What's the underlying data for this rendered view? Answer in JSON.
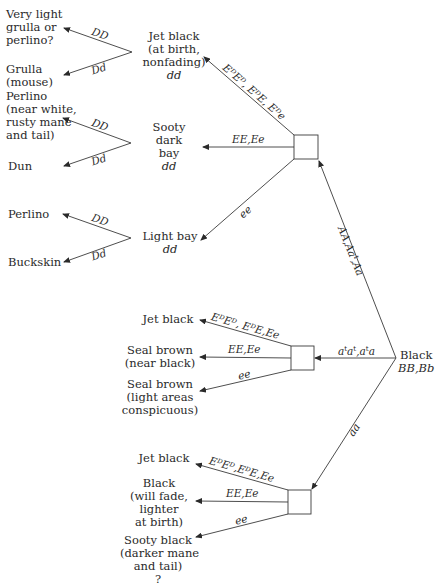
{
  "diagram": {
    "root": {
      "label": "Black",
      "genotype": "BB,Bb"
    },
    "root_branches": [
      {
        "label": "AA,Aa",
        "label_sup": "t",
        "label_full": "AA,Aat,Aa",
        "target": "group1"
      },
      {
        "label": "atat,ata",
        "label_full": "aᵗaᵗ,aᵗa",
        "target": "group2"
      },
      {
        "label": "aa",
        "target": "group3"
      }
    ],
    "group1": {
      "branches": [
        {
          "edge": "EᴰEᴰ, EᴰE, Eᴰe",
          "node": {
            "lines": [
              "Jet black",
              "(at birth,",
              "nonfading)"
            ],
            "genotype": "dd"
          }
        },
        {
          "edge": "EE,Ee",
          "node": {
            "lines": [
              "Sooty",
              "dark",
              "bay"
            ],
            "genotype": "dd"
          }
        },
        {
          "edge": "ee",
          "node": {
            "lines": [
              "Light bay"
            ],
            "genotype": "dd"
          }
        }
      ],
      "dun_forks": [
        {
          "from": "Jet black",
          "DD": {
            "edge": "DD",
            "lines": [
              "Very light",
              "grulla or",
              "perlino?"
            ]
          },
          "Dd": {
            "edge": "Dd",
            "lines": [
              "Grulla",
              "(mouse)"
            ]
          }
        },
        {
          "from": "Sooty dark bay",
          "DD": {
            "edge": "DD",
            "lines": [
              "Perlino",
              "(near white,",
              "rusty mane",
              "and tail)"
            ]
          },
          "Dd": {
            "edge": "Dd",
            "lines": [
              "Dun"
            ]
          }
        },
        {
          "from": "Light bay",
          "DD": {
            "edge": "DD",
            "lines": [
              "Perlino"
            ]
          },
          "Dd": {
            "edge": "Dd",
            "lines": [
              "Buckskin"
            ]
          }
        }
      ]
    },
    "group2": {
      "branches": [
        {
          "edge": "EᴰEᴰ, EᴰE,Ee",
          "lines": [
            "Jet black"
          ]
        },
        {
          "edge": "EE,Ee",
          "lines": [
            "Seal brown",
            "(near black)"
          ]
        },
        {
          "edge": "ee",
          "lines": [
            "Seal brown",
            "(light areas",
            "conspicuous)"
          ]
        }
      ]
    },
    "group3": {
      "branches": [
        {
          "edge": "EᴰEᴰ,EᴰE,Ee",
          "lines": [
            "Jet black"
          ]
        },
        {
          "edge": "EE,Ee",
          "lines": [
            "Black",
            "(will fade,",
            "lighter",
            "at birth)"
          ]
        },
        {
          "edge": "ee",
          "lines": [
            "Sooty black",
            "(darker mane",
            "and tail)",
            "?"
          ]
        }
      ]
    },
    "colors": {
      "ink": "#2a2a2a",
      "background": "#ffffff"
    }
  }
}
